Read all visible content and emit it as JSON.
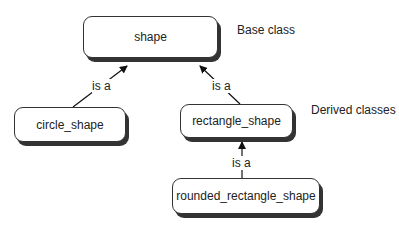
{
  "diagram": {
    "nodes": [
      {
        "id": "shape",
        "label": "shape"
      },
      {
        "id": "circle_shape",
        "label": "circle_shape"
      },
      {
        "id": "rectangle_shape",
        "label": "rectangle_shape"
      },
      {
        "id": "rounded_rectangle_shape",
        "label": "rounded_rectangle_shape"
      }
    ],
    "edges": [
      {
        "from": "circle_shape",
        "to": "shape",
        "label": "is a"
      },
      {
        "from": "rectangle_shape",
        "to": "shape",
        "label": "is a"
      },
      {
        "from": "rounded_rectangle_shape",
        "to": "rectangle_shape",
        "label": "is a"
      }
    ],
    "annotations": {
      "base": "Base class",
      "derived": "Derived classes"
    }
  }
}
